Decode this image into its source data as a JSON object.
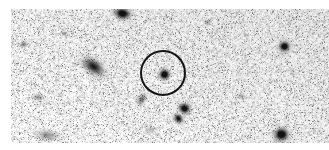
{
  "figure": {
    "kind": "astronomical-sky-image",
    "title": "",
    "caption": "",
    "width_px": 329,
    "height_px": 150,
    "background_color": "#ffffff",
    "colormap": "inverted-grayscale",
    "noise_description": "speckled grayscale background noise (inverted sky counts)"
  },
  "frame": {
    "x": 11,
    "y": 9,
    "width": 318,
    "height": 134,
    "border": "none",
    "margin_color": "#ffffff"
  },
  "chart_data": {
    "type": "scatter",
    "title": "",
    "xlabel": "",
    "ylabel": "",
    "xlim": [
      11,
      329
    ],
    "ylim": [
      9,
      143
    ],
    "grid": false,
    "legend": null,
    "noise": {
      "seed": 20240517,
      "grain_px": 1.35,
      "density": 0.5,
      "min_gray": 150,
      "max_gray": 255,
      "dark_speck_probability": 0.055,
      "dark_speck_gray": 120
    },
    "sources": [
      {
        "id": "source-top-left",
        "label": "",
        "x": 122,
        "y": 13,
        "radius": 6.0,
        "peak": 0.93,
        "elongation": 1.45,
        "angle_deg": 10,
        "kind": "star"
      },
      {
        "id": "source-left-extended",
        "label": "",
        "x": 93,
        "y": 66,
        "radius": 7.5,
        "peak": 0.72,
        "elongation": 1.7,
        "angle_deg": 35,
        "kind": "extended"
      },
      {
        "id": "source-target-circled",
        "label": "",
        "x": 164,
        "y": 74,
        "radius": 5.6,
        "peak": 1.0,
        "elongation": 1.0,
        "angle_deg": 0,
        "kind": "star"
      },
      {
        "id": "source-upper-right",
        "label": "",
        "x": 284,
        "y": 46,
        "radius": 5.6,
        "peak": 0.95,
        "elongation": 1.05,
        "angle_deg": 0,
        "kind": "star"
      },
      {
        "id": "source-lower-mid-a",
        "label": "",
        "x": 184,
        "y": 108,
        "radius": 5.6,
        "peak": 0.92,
        "elongation": 1.1,
        "angle_deg": 20,
        "kind": "star"
      },
      {
        "id": "source-lower-mid-b",
        "label": "",
        "x": 178,
        "y": 118,
        "radius": 4.4,
        "peak": 0.78,
        "elongation": 1.3,
        "angle_deg": 45,
        "kind": "star"
      },
      {
        "id": "source-lower-right",
        "label": "",
        "x": 281,
        "y": 134,
        "radius": 7.0,
        "peak": 0.97,
        "elongation": 1.1,
        "angle_deg": 0,
        "kind": "star"
      },
      {
        "id": "source-faint-center",
        "label": "",
        "x": 141,
        "y": 99,
        "radius": 4.2,
        "peak": 0.42,
        "elongation": 1.6,
        "angle_deg": 120,
        "kind": "faint"
      },
      {
        "id": "source-faint-lower-left",
        "label": "",
        "x": 47,
        "y": 135,
        "radius": 6.0,
        "peak": 0.3,
        "elongation": 2.1,
        "angle_deg": 5,
        "kind": "faint"
      },
      {
        "id": "source-faint-left-edge",
        "label": "",
        "x": 23,
        "y": 44,
        "radius": 3.2,
        "peak": 0.33,
        "elongation": 1.2,
        "angle_deg": 0,
        "kind": "faint"
      },
      {
        "id": "source-faint-left-mid",
        "label": "",
        "x": 38,
        "y": 97,
        "radius": 3.6,
        "peak": 0.3,
        "elongation": 1.8,
        "angle_deg": 0,
        "kind": "faint"
      },
      {
        "id": "source-faint-upper-mid",
        "label": "",
        "x": 207,
        "y": 22,
        "radius": 3.0,
        "peak": 0.26,
        "elongation": 1.3,
        "angle_deg": 0,
        "kind": "faint"
      },
      {
        "id": "source-faint-right-mid",
        "label": "",
        "x": 241,
        "y": 96,
        "radius": 3.2,
        "peak": 0.24,
        "elongation": 1.4,
        "angle_deg": 0,
        "kind": "faint"
      },
      {
        "id": "source-faint-upper-left",
        "label": "",
        "x": 64,
        "y": 33,
        "radius": 2.8,
        "peak": 0.25,
        "elongation": 1.2,
        "angle_deg": 0,
        "kind": "faint"
      },
      {
        "id": "source-faint-center-low",
        "label": "",
        "x": 150,
        "y": 129,
        "radius": 3.4,
        "peak": 0.22,
        "elongation": 1.6,
        "angle_deg": 0,
        "kind": "faint"
      }
    ],
    "annotations": [
      {
        "id": "target-circle",
        "shape": "circle",
        "cx": 163,
        "cy": 73,
        "r": 22,
        "stroke": "#141414",
        "stroke_width": 2,
        "fill": "none",
        "label": ""
      }
    ]
  }
}
